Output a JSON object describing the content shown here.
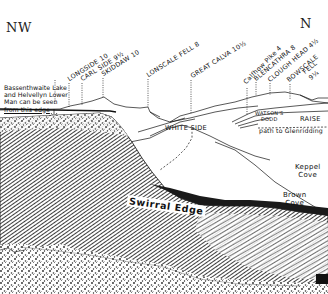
{
  "diagram": {
    "type": "panoramic fell view illustration",
    "compass": {
      "left": "NW",
      "right": "N"
    },
    "note": {
      "lines": [
        "Bassenthwaite Lake",
        "and Helvellyn Lower",
        "Man can be seen",
        "from this edge"
      ]
    },
    "peaks": [
      {
        "name": "LONGSIDE",
        "distance": "10",
        "label": "LONGSIDE 10"
      },
      {
        "name": "CARL SIDE",
        "distance": "9½",
        "label": "CARL SIDE 9½"
      },
      {
        "name": "SKIDDAW",
        "distance": "10",
        "label": "SKIDDAW 10"
      },
      {
        "name": "LONSCALE FELL",
        "distance": "8",
        "label": "LONSCALE FELL 8"
      },
      {
        "name": "GREAT CALVA",
        "distance": "10½",
        "label": "GREAT CALVA 10½"
      },
      {
        "name": "Calfhow Pike",
        "distance": "4",
        "label": "Calfhow Pike 4"
      },
      {
        "name": "BLENCATHRA",
        "distance": "8",
        "label": "BLENCATHRA 8"
      },
      {
        "name": "CLOUGH HEAD",
        "distance": "4½",
        "label": "CLOUGH HEAD 4½"
      },
      {
        "name": "BOWSCALE FELL",
        "distance": "9¼",
        "label_line1": "BOWSCALE",
        "label_line2": "FELL",
        "label_line3": "9¼"
      }
    ],
    "features": {
      "white_side": "WHITE SIDE",
      "watsons_dodd_line1": "WATSON'S",
      "watsons_dodd_line2": "DODD",
      "raise": "RAISE",
      "path": "path to Glenridding",
      "keppel_cove_line1": "Keppel",
      "keppel_cove_line2": "Cove",
      "brown_cove_line1": "Brown",
      "brown_cove_line2": "Cove",
      "swirral_edge": "Swirral Edge"
    },
    "colors": {
      "ink": "#111111",
      "paper": "#ffffff",
      "hatch": "#2a2a2a"
    }
  }
}
